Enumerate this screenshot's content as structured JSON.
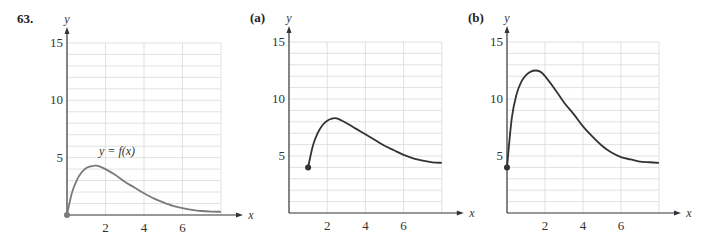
{
  "problem_number": "63.",
  "chart_data": [
    {
      "type": "line",
      "panel": "original",
      "label": "63.",
      "curve_label": "y = f(x)",
      "xlabel": "x",
      "ylabel": "y",
      "xlim": [
        0,
        8
      ],
      "ylim": [
        0,
        15
      ],
      "xticks": [
        2,
        4,
        6
      ],
      "yticks": [
        5,
        10,
        15
      ],
      "grid": true,
      "curve_color": "#7a7a7a",
      "start_point": {
        "x": 0,
        "y": 0,
        "filled": true
      },
      "x": [
        0,
        0.25,
        0.5,
        0.75,
        1,
        1.25,
        1.5,
        1.75,
        2,
        2.5,
        3,
        3.5,
        4,
        4.5,
        5,
        5.5,
        6,
        6.5,
        7,
        7.5,
        8
      ],
      "y": [
        0,
        1.9,
        3.0,
        3.7,
        4.1,
        4.25,
        4.3,
        4.2,
        4.0,
        3.5,
        2.9,
        2.4,
        1.9,
        1.45,
        1.1,
        0.8,
        0.6,
        0.45,
        0.35,
        0.3,
        0.28
      ]
    },
    {
      "type": "line",
      "panel": "a",
      "label": "(a)",
      "xlabel": "x",
      "ylabel": "y",
      "xlim": [
        0,
        8
      ],
      "ylim": [
        0,
        15
      ],
      "xticks": [
        2,
        4,
        6
      ],
      "yticks": [
        5,
        10,
        15
      ],
      "grid": true,
      "curve_color": "#333333",
      "start_point": {
        "x": 1,
        "y": 4,
        "filled": true
      },
      "x": [
        1,
        1.25,
        1.5,
        1.75,
        2,
        2.25,
        2.5,
        3,
        3.5,
        4,
        4.5,
        5,
        5.5,
        6,
        6.5,
        7,
        7.5,
        8
      ],
      "y": [
        4,
        5.9,
        7.0,
        7.7,
        8.1,
        8.28,
        8.3,
        7.9,
        7.4,
        6.9,
        6.4,
        5.9,
        5.5,
        5.1,
        4.8,
        4.6,
        4.45,
        4.4
      ]
    },
    {
      "type": "line",
      "panel": "b",
      "label": "(b)",
      "xlabel": "x",
      "ylabel": "y",
      "xlim": [
        0,
        8
      ],
      "ylim": [
        0,
        15
      ],
      "xticks": [
        2,
        4,
        6
      ],
      "yticks": [
        5,
        10,
        15
      ],
      "grid": true,
      "curve_color": "#333333",
      "start_point": {
        "x": 0,
        "y": 4,
        "filled": true
      },
      "x": [
        0,
        0.25,
        0.5,
        0.75,
        1,
        1.25,
        1.5,
        1.75,
        2,
        2.5,
        3,
        3.5,
        4,
        4.5,
        5,
        5.5,
        6,
        6.5,
        7,
        7.5,
        8
      ],
      "y": [
        4,
        8.3,
        10.4,
        11.5,
        12.1,
        12.4,
        12.5,
        12.4,
        12.0,
        10.9,
        9.7,
        8.7,
        7.6,
        6.7,
        5.9,
        5.3,
        4.9,
        4.7,
        4.5,
        4.45,
        4.4
      ]
    }
  ],
  "panels": [
    {
      "label": "63.",
      "ox": 67,
      "oy": 215,
      "sx": 19.25,
      "sy": 11.47
    },
    {
      "label": "(a)",
      "ox": 289,
      "oy": 213,
      "sx": 19.1,
      "sy": 11.4
    },
    {
      "label": "(b)",
      "ox": 507,
      "oy": 213,
      "sx": 19.0,
      "sy": 11.4
    }
  ]
}
